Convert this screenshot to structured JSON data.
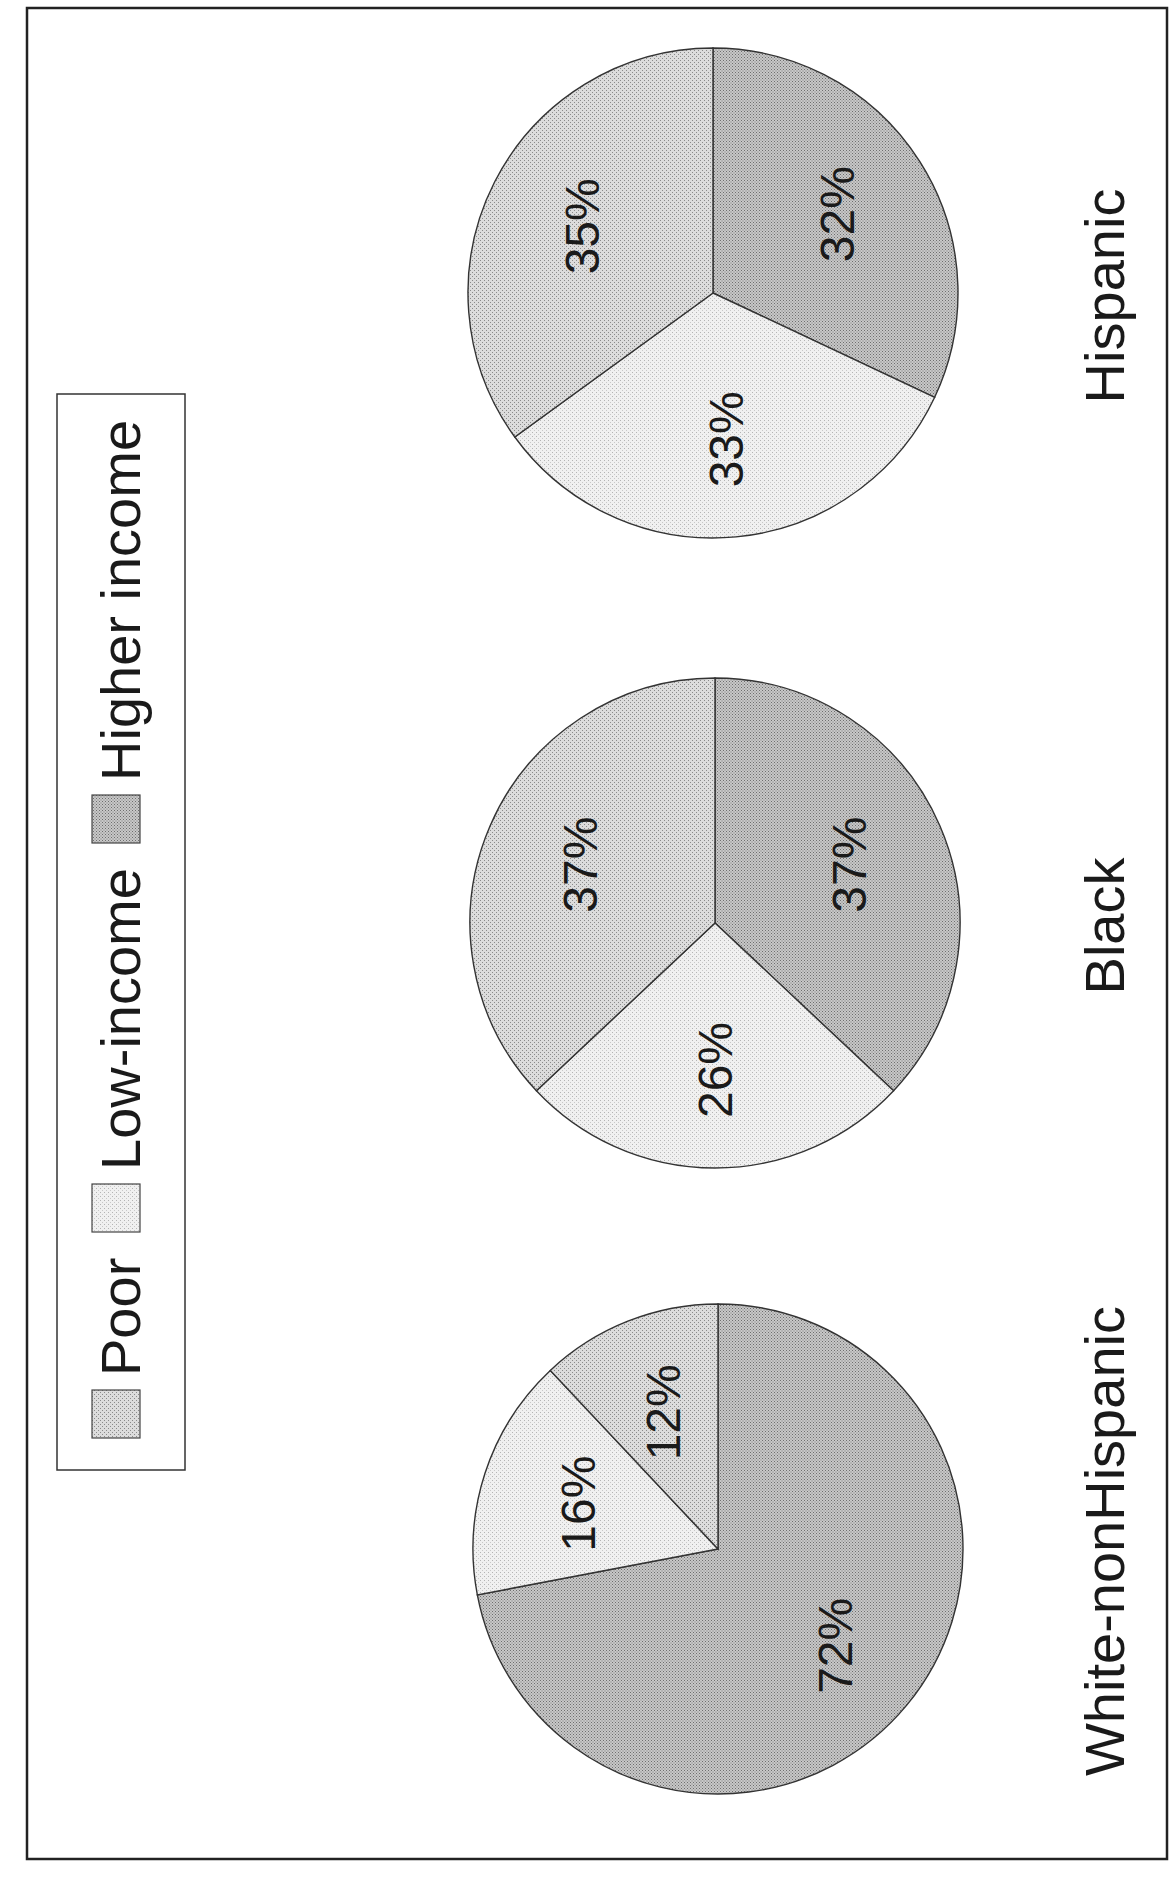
{
  "legend": {
    "items": [
      {
        "key": "poor",
        "label": "Poor",
        "color": "#d2d2d2"
      },
      {
        "key": "low",
        "label": "Low-income",
        "color": "#ececec"
      },
      {
        "key": "higher",
        "label": "Higher income",
        "color": "#b9b9b9"
      }
    ]
  },
  "groups": [
    {
      "name": "Hispanic",
      "values": {
        "higher": 32,
        "low": 33,
        "poor": 35
      },
      "labels": {
        "higher": "32%",
        "low": "33%",
        "poor": "35%"
      }
    },
    {
      "name": "Black",
      "values": {
        "higher": 37,
        "low": 26,
        "poor": 37
      },
      "labels": {
        "higher": "37%",
        "low": "26%",
        "poor": "37%"
      }
    },
    {
      "name": "White-nonHispanic",
      "values": {
        "higher": 72,
        "low": 16,
        "poor": 12
      },
      "labels": {
        "higher": "72%",
        "low": "16%",
        "poor": "12%"
      }
    }
  ],
  "chart_data": {
    "type": "pie",
    "orientation": "rotated 90 degrees counter-clockwise",
    "title": "",
    "categories": [
      "Poor",
      "Low-income",
      "Higher income"
    ],
    "series": [
      {
        "name": "White-nonHispanic",
        "values": [
          12,
          16,
          72
        ]
      },
      {
        "name": "Black",
        "values": [
          37,
          26,
          37
        ]
      },
      {
        "name": "Hispanic",
        "values": [
          35,
          33,
          32
        ]
      }
    ],
    "legend": [
      "Poor",
      "Low-income",
      "Higher income"
    ],
    "legend_position": "top (left side in rotated image)",
    "value_format": "percent"
  }
}
